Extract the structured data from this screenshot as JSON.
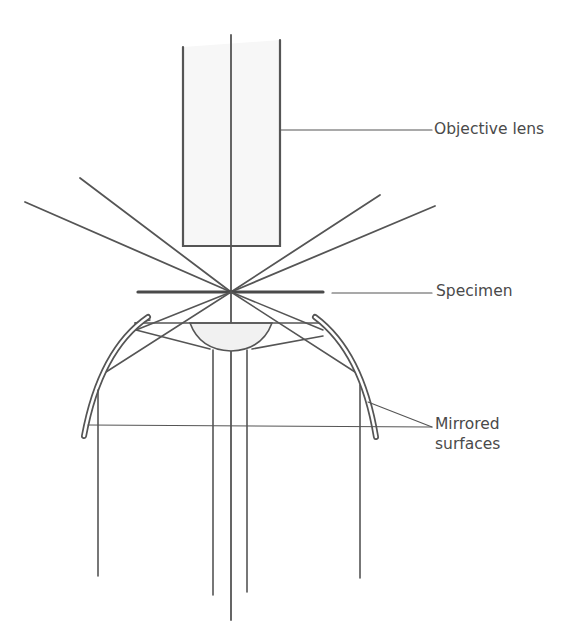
{
  "diagram": {
    "labels": {
      "objective_lens": "Objective lens",
      "specimen": "Specimen",
      "mirrored_line1": "Mirrored",
      "mirrored_line2": "surfaces"
    },
    "components": [
      {
        "id": "objective-lens",
        "label": "Objective lens"
      },
      {
        "id": "specimen",
        "label": "Specimen"
      },
      {
        "id": "condenser-lens",
        "label": ""
      },
      {
        "id": "mirrored-surfaces",
        "label": "Mirrored surfaces"
      }
    ],
    "colors": {
      "stroke": "#555555",
      "text": "#4a4a4a",
      "lens_fill": "#f4f4f4"
    }
  }
}
